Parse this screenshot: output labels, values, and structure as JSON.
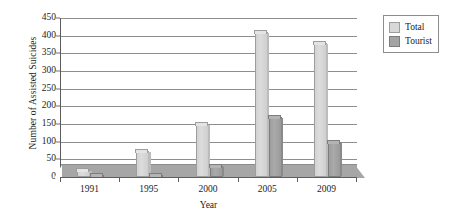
{
  "chart_data": {
    "type": "bar",
    "title": "",
    "xlabel": "Year",
    "ylabel": "Number of Assisted Suicides",
    "categories": [
      "1991",
      "1995",
      "2000",
      "2005",
      "2009"
    ],
    "series": [
      {
        "name": "Total",
        "values": [
          20,
          75,
          150,
          410,
          380
        ],
        "color": "#d8d8d8"
      },
      {
        "name": "Tourist",
        "values": [
          3,
          3,
          30,
          170,
          100
        ],
        "color": "#a4a4a4"
      }
    ],
    "ylim": [
      0,
      450
    ],
    "ytick_values": [
      0,
      50,
      100,
      150,
      200,
      250,
      300,
      350,
      400,
      450
    ],
    "ytick_labels": [
      "0",
      "50",
      "100",
      "150",
      "200",
      "250",
      "300",
      "350",
      "400",
      "450"
    ],
    "grid": true,
    "grid_axis": "y",
    "legend_position": "right-top",
    "legend_entries": [
      "Total",
      "Tourist"
    ],
    "floor_band_height": 35,
    "style": "3d-grouped-bar"
  }
}
